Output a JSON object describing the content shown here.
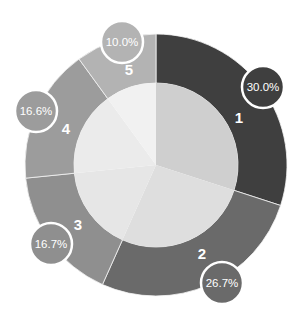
{
  "chart_data": {
    "type": "pie",
    "variant": "donut-with-inner-pie",
    "title": "",
    "categories": [
      "1",
      "2",
      "3",
      "4",
      "5"
    ],
    "values": [
      30.0,
      26.7,
      16.7,
      16.6,
      10.0
    ],
    "value_labels": [
      "30.0%",
      "26.7%",
      "16.7%",
      "16.6%",
      "10.0%"
    ],
    "start_angle_deg": 0,
    "direction": "clockwise",
    "outer_colors": [
      "#3f3f3f",
      "#6a6a6a",
      "#8f8f8f",
      "#9c9c9c",
      "#b3b3b3"
    ],
    "inner_colors": [
      "#cfcfcf",
      "#dedede",
      "#e6e6e6",
      "#ebebeb",
      "#f1f1f1"
    ],
    "legend": "none",
    "grid": false
  },
  "geometry": {
    "cx": 156,
    "cy": 165,
    "outer_r": 131,
    "inner_r": 82,
    "badge_r": 21
  },
  "badges": [
    {
      "x": 263,
      "y": 87
    },
    {
      "x": 222,
      "y": 283
    },
    {
      "x": 51,
      "y": 244
    },
    {
      "x": 36,
      "y": 111
    },
    {
      "x": 122,
      "y": 42
    }
  ],
  "segment_label_pos": [
    {
      "x": 239,
      "y": 123
    },
    {
      "x": 202,
      "y": 259
    },
    {
      "x": 78,
      "y": 230
    },
    {
      "x": 66,
      "y": 134
    },
    {
      "x": 129,
      "y": 75
    }
  ]
}
